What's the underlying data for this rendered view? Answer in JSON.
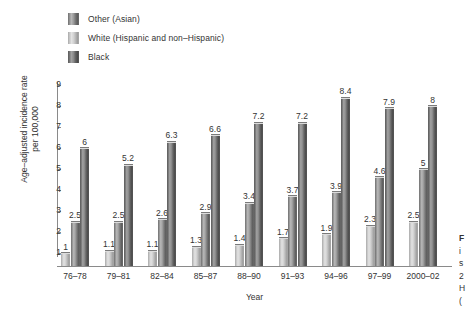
{
  "chart_data": {
    "type": "bar",
    "title": "",
    "subtitle": "",
    "xlabel": "Year",
    "ylabel": "Age–adjusted incidence rate per 100,000",
    "ylabel_line1": "Age–adjusted incidence rate",
    "ylabel_line2": "per 100,000",
    "categories": [
      "76–78",
      "79–81",
      "82–84",
      "85–87",
      "88–90",
      "91–93",
      "94–96",
      "97–99",
      "2000–02"
    ],
    "series": [
      {
        "name": "White (Hispanic and non–Hispanic)",
        "key": "white",
        "values": [
          1,
          1.1,
          1.1,
          1.3,
          1.4,
          1.7,
          1.9,
          2.3,
          2.5
        ],
        "labels": [
          "1",
          "1.1",
          "1.1",
          "1.3",
          "1.4",
          "1.7",
          "1.9",
          "2.3",
          "2.5"
        ],
        "color": "#d2d2d2"
      },
      {
        "name": "Other (Asian)",
        "key": "other",
        "values": [
          2.5,
          2.5,
          2.6,
          2.9,
          3.4,
          3.7,
          3.9,
          4.6,
          5
        ],
        "labels": [
          "2.5",
          "2.5",
          "2.6",
          "2.9",
          "3.4",
          "3.7",
          "3.9",
          "4.6",
          "5"
        ],
        "color": "#9c9c9c"
      },
      {
        "name": "Black",
        "key": "black",
        "values": [
          6,
          5.2,
          6.3,
          6.6,
          7.2,
          7.2,
          8.4,
          7.9,
          8
        ],
        "labels": [
          "6",
          "5.2",
          "6.3",
          "6.6",
          "7.2",
          "7.2",
          "8.4",
          "7.9",
          "8"
        ],
        "color": "#8a8a8a"
      }
    ],
    "yticks": [
      1,
      2,
      3,
      4,
      5,
      6,
      7,
      8,
      9
    ],
    "ytick_labels": [
      "1",
      "2",
      "3",
      "4",
      "5",
      "6",
      "7",
      "8",
      "9"
    ],
    "ylim": [
      0,
      9
    ],
    "grid": false,
    "legend_position": "top-left",
    "bar_order_in_group": [
      "white",
      "other",
      "black"
    ]
  },
  "legend": {
    "items": [
      {
        "label": "Other (Asian)",
        "swatch": "fill-other"
      },
      {
        "label": "White (Hispanic and non–Hispanic)",
        "swatch": "fill-white"
      },
      {
        "label": "Black",
        "swatch": "fill-black"
      }
    ]
  },
  "caption_fragment": {
    "lines": [
      "F",
      "i",
      "s",
      "2",
      "H",
      "("
    ]
  }
}
